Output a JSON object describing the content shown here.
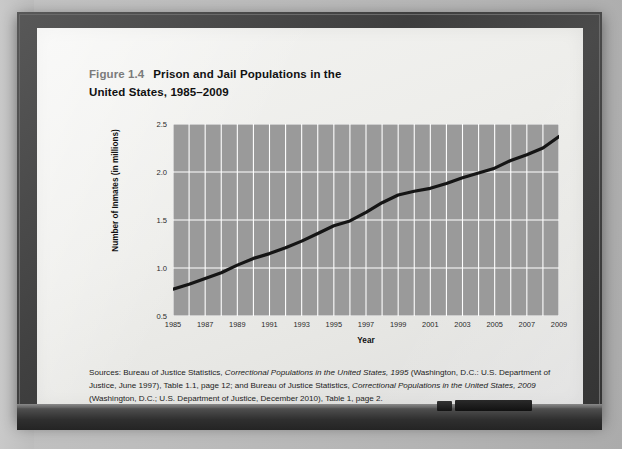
{
  "figure": {
    "number": "Figure 1.4",
    "title": "Prison and Jail Populations in the United States, 1985–2009",
    "title_line1": "Prison and Jail Populations in the",
    "title_line2": "United States, 1985–2009"
  },
  "credit": "Mark Stahl/iStockphoto.com",
  "sources": {
    "line1_a": "Sources: Bureau of Justice Statistics, ",
    "line1_i": "Correctional Populations in the United States, 1995",
    "line1_b": " (Washington, D.C.: U.S. Department of Justice, June 1997), Table 1.1, page 12; and Bureau of Justice Statistics, ",
    "line2_i": "Correctional Populations in the United States, 2009",
    "line2_b": " (Washington, D.C.; U.S. Department of Justice, December 2010), Table 1, page 2."
  },
  "colors": {
    "plot_background": "#9a9a9a",
    "gridline": "#ffffff",
    "line": "#151515",
    "figure_number": "#7b7b7b",
    "frame": "#3e3e3e",
    "board": "#eeeeeb"
  },
  "chart_data": {
    "type": "line",
    "title": "Prison and Jail Populations in the United States, 1985–2009",
    "xlabel": "Year",
    "ylabel": "Number of Inmates (in millions)",
    "xlim": [
      1985,
      2009
    ],
    "ylim": [
      0.5,
      2.5
    ],
    "yticks": [
      0.5,
      1.0,
      1.5,
      2.0,
      2.5
    ],
    "ytick_labels": [
      "0.5",
      "1.0",
      "1.5",
      "2.0",
      "2.5"
    ],
    "xticks": [
      1985,
      1987,
      1989,
      1991,
      1993,
      1995,
      1997,
      1999,
      2001,
      2003,
      2005,
      2007,
      2009
    ],
    "xtick_labels": [
      "1985",
      "1987",
      "1989",
      "1991",
      "1993",
      "1995",
      "1997",
      "1999",
      "2001",
      "2003",
      "2005",
      "2007",
      "2009"
    ],
    "grid": true,
    "grid_x_every": 1,
    "grid_y_every": 0.5,
    "legend": null,
    "x": [
      1985,
      1986,
      1987,
      1988,
      1989,
      1990,
      1991,
      1992,
      1993,
      1994,
      1995,
      1996,
      1997,
      1998,
      1999,
      2000,
      2001,
      2002,
      2003,
      2004,
      2005,
      2006,
      2007,
      2008,
      2009
    ],
    "values": [
      0.78,
      0.83,
      0.89,
      0.95,
      1.03,
      1.1,
      1.15,
      1.21,
      1.28,
      1.36,
      1.44,
      1.49,
      1.58,
      1.68,
      1.76,
      1.8,
      1.83,
      1.88,
      1.94,
      1.99,
      2.04,
      2.12,
      2.18,
      2.25,
      2.37
    ],
    "series": [
      {
        "name": "Prison and jail population",
        "values": [
          0.78,
          0.83,
          0.89,
          0.95,
          1.03,
          1.1,
          1.15,
          1.21,
          1.28,
          1.36,
          1.44,
          1.49,
          1.58,
          1.68,
          1.76,
          1.8,
          1.83,
          1.88,
          1.94,
          1.99,
          2.04,
          2.12,
          2.18,
          2.25,
          2.37
        ]
      }
    ]
  }
}
